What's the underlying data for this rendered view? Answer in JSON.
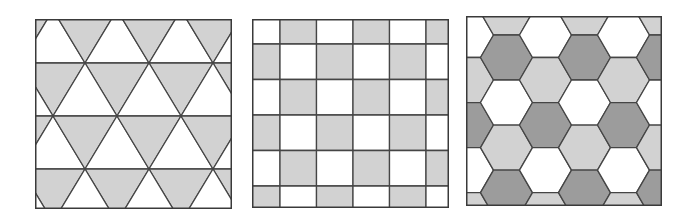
{
  "figure": {
    "colors": {
      "white": "#ffffff",
      "light_gray": "#d2d2d2",
      "dark_gray": "#9c9c9c",
      "line": "#454545"
    },
    "panels": [
      {
        "id": "triangle-tiling",
        "label": "Triangular tiling",
        "box": {
          "x": 35,
          "y": 19,
          "w": 197,
          "h": 190
        },
        "side": 64,
        "row_height": 53,
        "first_line_y": 44,
        "vertex_offset_a": 50,
        "vertex_offset_b": 18,
        "fill_down": "light_gray",
        "fill_up": "white"
      },
      {
        "id": "square-tiling",
        "label": "Square tiling",
        "box": {
          "x": 252,
          "y": 19,
          "w": 197,
          "h": 189
        },
        "cell_w": 36.5,
        "cell_h": 35.5,
        "offset_x": -8.5,
        "offset_y": -10.5,
        "fill_a": "light_gray",
        "fill_b": "white"
      },
      {
        "id": "hexagon-tiling",
        "label": "Hexagonal tiling",
        "box": {
          "x": 466,
          "y": 16,
          "w": 196,
          "h": 190
        },
        "side": 26,
        "first_center_x": 40.5,
        "first_center_y": 41.5,
        "palette_cycle": [
          "dark_gray",
          "light_gray",
          "white"
        ]
      }
    ]
  }
}
